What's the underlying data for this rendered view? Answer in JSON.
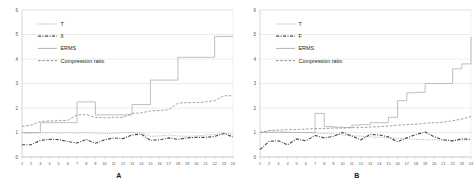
{
  "figure": {
    "background": "#ffffff",
    "panels": [
      {
        "caption": "A",
        "name": "chart-panel-a"
      },
      {
        "caption": "B",
        "name": "chart-panel-b"
      }
    ]
  },
  "chart_data": [
    {
      "type": "line",
      "title": "A",
      "xlabel": "",
      "ylabel": "",
      "xlim": [
        1,
        24
      ],
      "ylim": [
        0,
        6
      ],
      "yticks": [
        0,
        1,
        2,
        3,
        4,
        5,
        6
      ],
      "ytick_labels": [
        "0",
        "1",
        "2",
        "3",
        "4",
        "5",
        "6"
      ],
      "x": [
        1,
        2,
        3,
        4,
        5,
        6,
        7,
        8,
        9,
        10,
        11,
        12,
        13,
        14,
        15,
        16,
        17,
        18,
        19,
        20,
        21,
        22,
        23,
        24
      ],
      "xtick_labels": [
        "1",
        "2",
        "3",
        "4",
        "5",
        "6",
        "7",
        "8",
        "9",
        "10",
        "11",
        "12",
        "13",
        "14",
        "15",
        "16",
        "17",
        "18",
        "19",
        "20",
        "21",
        "22",
        "23",
        "24"
      ],
      "grid": true,
      "legend_position": "upper-left",
      "series": [
        {
          "name": "T",
          "style": "dotted",
          "color": "#9a9a9a",
          "values": [
            0.97,
            0.96,
            0.99,
            0.99,
            0.98,
            0.99,
            0.98,
            0.99,
            0.98,
            0.95,
            0.97,
            0.99,
            1.0,
            0.99,
            0.84,
            0.86,
            0.9,
            0.86,
            0.84,
            0.86,
            0.9,
            0.92,
            0.96,
            0.94
          ]
        },
        {
          "name": "δ",
          "style": "dash-dot",
          "color": "#4a4a4a",
          "values": [
            0.5,
            0.5,
            0.68,
            0.72,
            0.71,
            0.63,
            0.57,
            0.72,
            0.56,
            0.7,
            0.78,
            0.75,
            0.9,
            0.94,
            0.68,
            0.7,
            0.78,
            0.72,
            0.78,
            0.8,
            0.8,
            0.84,
            0.96,
            0.82
          ]
        },
        {
          "name": "ERMS",
          "style": "solid-step",
          "color": "#b3b3b3",
          "values": [
            1.0,
            1.0,
            1.4,
            1.4,
            1.4,
            1.4,
            2.25,
            2.25,
            1.72,
            1.72,
            1.72,
            1.72,
            2.14,
            2.14,
            3.14,
            3.14,
            3.14,
            4.07,
            4.07,
            4.07,
            4.07,
            4.92,
            4.92,
            4.92
          ]
        },
        {
          "name": "Compression ratio",
          "style": "dashed",
          "color": "#8a8a8a",
          "values": [
            1.25,
            1.3,
            1.45,
            1.47,
            1.48,
            1.5,
            1.72,
            1.73,
            1.62,
            1.6,
            1.62,
            1.62,
            1.78,
            1.8,
            1.88,
            1.9,
            1.93,
            2.2,
            2.22,
            2.22,
            2.25,
            2.3,
            2.5,
            2.5
          ]
        }
      ]
    },
    {
      "type": "line",
      "title": "B",
      "xlabel": "",
      "ylabel": "",
      "xlim": [
        1,
        24
      ],
      "ylim": [
        0,
        6
      ],
      "yticks": [
        0,
        1,
        2,
        3,
        4,
        5,
        6
      ],
      "ytick_labels": [
        "0",
        "1",
        "2",
        "3",
        "4",
        "5",
        "6"
      ],
      "x": [
        1,
        2,
        3,
        4,
        5,
        6,
        7,
        8,
        9,
        10,
        11,
        12,
        13,
        14,
        15,
        16,
        17,
        18,
        19,
        20,
        21,
        22,
        23,
        24
      ],
      "xtick_labels": [
        "1",
        "2",
        "3",
        "4",
        "5",
        "6",
        "7",
        "8",
        "9",
        "10",
        "11",
        "12",
        "13",
        "14",
        "15",
        "16",
        "17",
        "18",
        "19",
        "20",
        "21",
        "22",
        "23",
        "24"
      ],
      "grid": true,
      "legend_position": "upper-left",
      "series": [
        {
          "name": "T",
          "style": "dotted",
          "color": "#9a9a9a",
          "values": [
            1.0,
            1.06,
            1.05,
            1.02,
            1.0,
            1.0,
            0.98,
            0.96,
            0.94,
            0.9,
            0.86,
            0.85,
            0.82,
            0.8,
            0.78,
            0.76,
            0.75,
            0.72,
            0.7,
            0.7,
            0.68,
            0.68,
            0.7,
            0.7
          ]
        },
        {
          "name": "F",
          "style": "dash-dot",
          "color": "#4a4a4a",
          "values": [
            0.3,
            0.64,
            0.66,
            0.5,
            0.74,
            0.66,
            0.88,
            0.78,
            0.84,
            1.0,
            0.86,
            0.7,
            0.92,
            0.9,
            0.82,
            0.62,
            0.78,
            0.92,
            1.02,
            0.82,
            0.7,
            0.66,
            0.74,
            0.72
          ]
        },
        {
          "name": "ERMS",
          "style": "solid-step",
          "color": "#b3b3b3",
          "values": [
            1.0,
            1.0,
            1.0,
            1.0,
            1.0,
            1.0,
            1.78,
            1.24,
            1.22,
            1.2,
            1.3,
            1.32,
            1.4,
            1.4,
            1.62,
            2.3,
            2.62,
            2.64,
            3.0,
            3.0,
            3.0,
            3.6,
            3.8,
            4.9
          ]
        },
        {
          "name": "Compression ratio",
          "style": "dashed",
          "color": "#8a8a8a",
          "values": [
            1.0,
            1.08,
            1.1,
            1.12,
            1.12,
            1.14,
            1.16,
            1.16,
            1.18,
            1.18,
            1.2,
            1.2,
            1.22,
            1.24,
            1.26,
            1.3,
            1.32,
            1.34,
            1.38,
            1.4,
            1.42,
            1.48,
            1.55,
            1.65
          ]
        }
      ]
    }
  ]
}
